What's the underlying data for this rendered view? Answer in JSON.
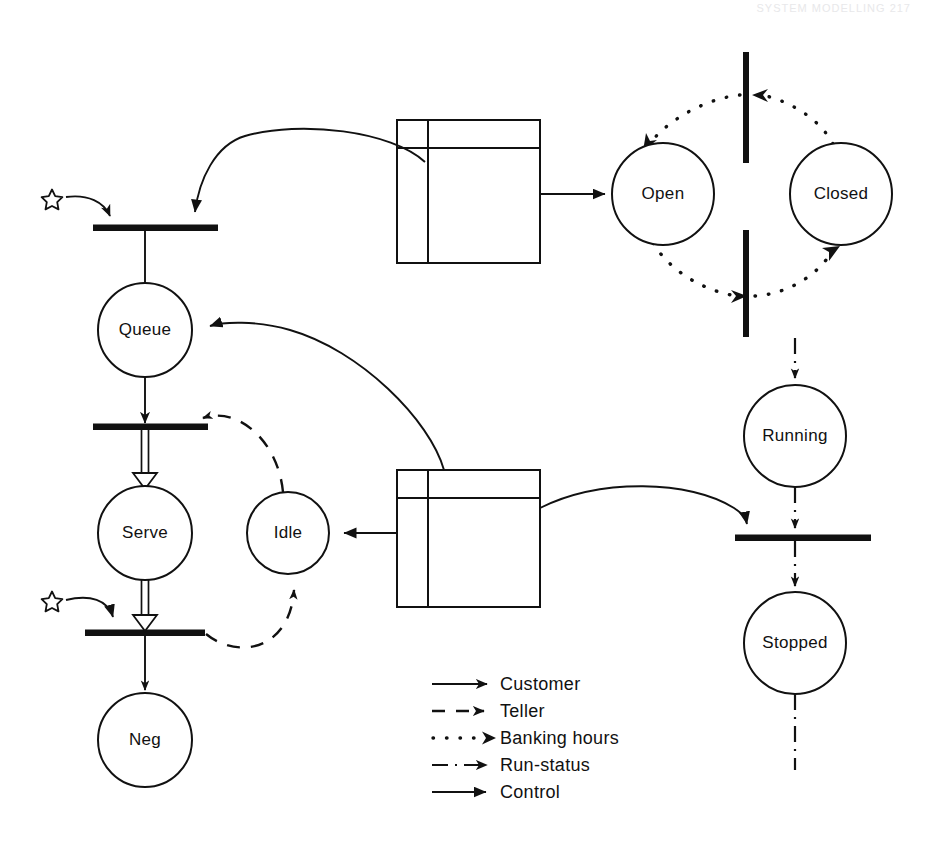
{
  "page": {
    "header_note": "SYSTEM MODELLING   217",
    "background_color": "#ffffff",
    "ink_color": "#111111",
    "width": 925,
    "height": 847
  },
  "places": [
    {
      "id": "queue",
      "label": "Queue",
      "cx": 145,
      "cy": 330,
      "r": 47
    },
    {
      "id": "serve",
      "label": "Serve",
      "cx": 145,
      "cy": 533,
      "r": 47
    },
    {
      "id": "neg",
      "label": "Neg",
      "cx": 145,
      "cy": 740,
      "r": 47
    },
    {
      "id": "idle",
      "label": "Idle",
      "cx": 288,
      "cy": 533,
      "r": 41
    },
    {
      "id": "open",
      "label": "Open",
      "cx": 663,
      "cy": 194,
      "r": 51
    },
    {
      "id": "closed",
      "label": "Closed",
      "cx": 841,
      "cy": 194,
      "r": 51
    },
    {
      "id": "running",
      "label": "Running",
      "cx": 795,
      "cy": 436,
      "r": 51
    },
    {
      "id": "stopped",
      "label": "Stopped",
      "cx": 795,
      "cy": 643,
      "r": 51
    }
  ],
  "transitions": [
    {
      "id": "t-arrive",
      "orientation": "horizontal",
      "x1": 93,
      "x2": 218,
      "y": 228
    },
    {
      "id": "t-begin-serve",
      "orientation": "horizontal",
      "x1": 93,
      "x2": 208,
      "y": 427
    },
    {
      "id": "t-end-serve",
      "orientation": "horizontal",
      "x1": 85,
      "x2": 205,
      "y": 633
    },
    {
      "id": "t-open",
      "orientation": "vertical",
      "y1": 52,
      "y2": 163,
      "x": 746
    },
    {
      "id": "t-close",
      "orientation": "vertical",
      "y1": 230,
      "y2": 337,
      "x": 746
    },
    {
      "id": "t-stop",
      "orientation": "horizontal",
      "x1": 735,
      "x2": 871,
      "y": 538
    }
  ],
  "modules": [
    {
      "id": "module-hours",
      "x": 397,
      "y": 120,
      "w": 143,
      "h": 143,
      "top_rule_y": 148,
      "left_rule_x": 428
    },
    {
      "id": "module-teller",
      "x": 397,
      "y": 470,
      "w": 143,
      "h": 137,
      "top_rule_y": 498,
      "left_rule_x": 428
    }
  ],
  "tokens": [
    {
      "id": "token-customer-source",
      "cx": 52,
      "cy": 199
    },
    {
      "id": "token-teller-source",
      "cx": 52,
      "cy": 601
    }
  ],
  "legend": {
    "title": "Arc types",
    "x": 432,
    "y": 684,
    "items": [
      {
        "id": "legend-customer",
        "label": "Customer",
        "style": "solid",
        "arrowhead": "open-filled"
      },
      {
        "id": "legend-teller",
        "label": "Teller",
        "style": "dashed",
        "arrowhead": "open-filled"
      },
      {
        "id": "legend-banking-hours",
        "label": "Banking hours",
        "style": "dotted",
        "arrowhead": "open-filled"
      },
      {
        "id": "legend-run-status",
        "label": "Run-status",
        "style": "dashdot",
        "arrowhead": "open-filled"
      },
      {
        "id": "legend-control",
        "label": "Control",
        "style": "solid",
        "arrowhead": "solid-filled"
      }
    ]
  },
  "arcs": [
    {
      "id": "arc-customer-source-to-arrive",
      "type": "Customer",
      "from": "token-customer-source",
      "to": "t-arrive"
    },
    {
      "id": "arc-hours-to-arrive",
      "type": "Control",
      "from": "module-hours",
      "to": "t-arrive"
    },
    {
      "id": "arc-arrive-to-queue",
      "type": "Customer",
      "from": "t-arrive",
      "to": "queue"
    },
    {
      "id": "arc-queue-to-begin",
      "type": "Customer",
      "from": "queue",
      "to": "t-begin-serve"
    },
    {
      "id": "arc-begin-to-serve",
      "type": "Teller",
      "from": "t-begin-serve",
      "to": "serve"
    },
    {
      "id": "arc-serve-to-end",
      "type": "Teller",
      "from": "serve",
      "to": "t-end-serve"
    },
    {
      "id": "arc-end-to-neg",
      "type": "Customer",
      "from": "t-end-serve",
      "to": "neg"
    },
    {
      "id": "arc-teller-source-to-end",
      "type": "Customer",
      "from": "token-teller-source",
      "to": "t-end-serve"
    },
    {
      "id": "arc-end-to-idle",
      "type": "Teller",
      "from": "t-end-serve",
      "to": "idle"
    },
    {
      "id": "arc-idle-to-begin",
      "type": "Teller",
      "from": "idle",
      "to": "t-begin-serve"
    },
    {
      "id": "arc-teller-module-to-idle",
      "type": "Control",
      "from": "module-teller",
      "to": "idle"
    },
    {
      "id": "arc-teller-module-to-queue",
      "type": "Control",
      "from": "module-teller",
      "to": "queue"
    },
    {
      "id": "arc-teller-module-to-stop",
      "type": "Control",
      "from": "module-teller",
      "to": "t-stop"
    },
    {
      "id": "arc-hours-module-to-open",
      "type": "Control",
      "from": "module-hours",
      "to": "open"
    },
    {
      "id": "arc-open-to-close",
      "type": "Banking hours",
      "from": "open",
      "to": "t-close"
    },
    {
      "id": "arc-close-to-closed",
      "type": "Banking hours",
      "from": "t-close",
      "to": "closed"
    },
    {
      "id": "arc-closed-to-open-transition",
      "type": "Banking hours",
      "from": "closed",
      "to": "t-open"
    },
    {
      "id": "arc-open-transition-to-open",
      "type": "Banking hours",
      "from": "t-open",
      "to": "open"
    },
    {
      "id": "arc-in-to-running",
      "type": "Run-status",
      "from": "external",
      "to": "running"
    },
    {
      "id": "arc-running-to-stop",
      "type": "Run-status",
      "from": "running",
      "to": "t-stop"
    },
    {
      "id": "arc-stop-to-stopped",
      "type": "Run-status",
      "from": "t-stop",
      "to": "stopped"
    },
    {
      "id": "arc-stopped-out",
      "type": "Run-status",
      "from": "stopped",
      "to": "external"
    }
  ]
}
